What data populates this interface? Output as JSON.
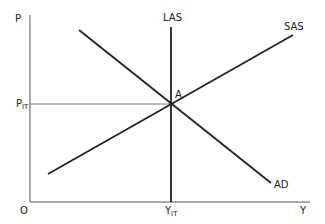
{
  "diagram": {
    "title": "",
    "type": "aggregate-supply-aggregate-demand",
    "axes": {
      "y_label": "P",
      "x_label": "Y",
      "origin_label": "O"
    },
    "equilibrium": {
      "point_label": "A",
      "price_label_main": "P",
      "price_label_sub": "IT",
      "output_label_main": "Y",
      "output_label_sub": "IT"
    },
    "curves": [
      {
        "name": "LAS",
        "label": "LAS",
        "shape": "vertical"
      },
      {
        "name": "SAS",
        "label": "SAS",
        "shape": "upward-sloping"
      },
      {
        "name": "AD",
        "label": "AD",
        "shape": "downward-sloping"
      }
    ],
    "colors": {
      "line": "#222222",
      "axis": "#555555",
      "background": "#ffffff"
    }
  }
}
